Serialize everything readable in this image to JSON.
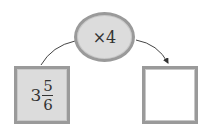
{
  "operation": {
    "label": "×4"
  },
  "input": {
    "whole": "3",
    "numerator": "5",
    "denominator": "6"
  },
  "output": {
    "value": ""
  },
  "colors": {
    "fill": "#dcdcdc",
    "border": "#9a9a9a",
    "arrow": "#333333"
  }
}
